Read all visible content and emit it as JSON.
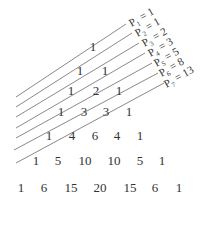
{
  "diagram": {
    "title": "",
    "rows": [
      [
        "1"
      ],
      [
        "1",
        "1"
      ],
      [
        "1",
        "2",
        "1"
      ],
      [
        "1",
        "3",
        "3",
        "1"
      ],
      [
        "1",
        "4",
        "6",
        "4",
        "1"
      ],
      [
        "1",
        "5",
        "10",
        "10",
        "5",
        "1"
      ],
      [
        "1",
        "6",
        "15",
        "20",
        "15",
        "6",
        "1"
      ]
    ],
    "diagonals": [
      {
        "var": "P",
        "sub": "1",
        "value": "1"
      },
      {
        "var": "P",
        "sub": "2",
        "value": "1"
      },
      {
        "var": "P",
        "sub": "3",
        "value": "2"
      },
      {
        "var": "P",
        "sub": "4",
        "value": "3"
      },
      {
        "var": "P",
        "sub": "5",
        "value": "5"
      },
      {
        "var": "P",
        "sub": "6",
        "value": "8"
      },
      {
        "var": "P",
        "sub": "7",
        "value": "13"
      }
    ],
    "line_color": "#8a8a8a",
    "text_color": "#333333"
  }
}
